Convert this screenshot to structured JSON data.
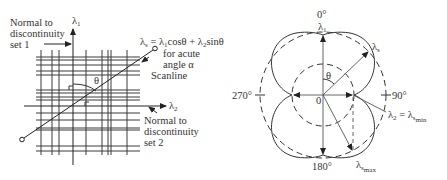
{
  "left_diagram": {
    "axis_vertical_label": "λ",
    "axis_vertical_sub": "1",
    "axis_horizontal_label": "λ",
    "axis_horizontal_sub": "2",
    "normal_set1": [
      "Normal to",
      "discontinuity",
      "set 1"
    ],
    "normal_set2": [
      "Normal to",
      "discontinuity",
      "set 2"
    ],
    "equation": {
      "lhs": "λ",
      "lhs_sub": "s",
      "eq": " = λ",
      "t1_sub": "1",
      "t1": "cosθ + λ",
      "t2_sub": "2",
      "t2": "sinθ"
    },
    "equation_note": [
      "for acute",
      "angle α"
    ],
    "scanline_label": "Scanline",
    "angle_label": "θ"
  },
  "right_diagram": {
    "top_angle": "0°",
    "right_angle": "90°",
    "bottom_angle": "180°",
    "left_angle": "270°",
    "lambda1": "λ",
    "lambda1_sub": "1",
    "lambdas": "λ",
    "lambdas_sub": "s",
    "origin": "0",
    "theta": "θ",
    "lambda2_eq": "λ",
    "lambda2_sub": "2",
    "lambda2_rest": " = λ",
    "lambda2_min_sub": "s",
    "lambda2_min_subsub": "min",
    "lambdamax": "λ",
    "lambdamax_sub": "s",
    "lambdamax_subsub": "max"
  }
}
